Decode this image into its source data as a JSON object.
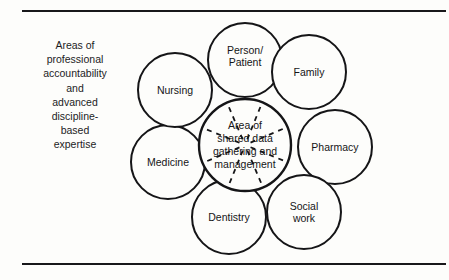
{
  "figure": {
    "title_caption": {
      "lines": [
        "Areas of",
        "professional",
        "accountability",
        "and",
        "advanced",
        "discipline-",
        "based",
        "expertise"
      ]
    },
    "center": {
      "name": "area-of-shared-data",
      "lines": [
        "Area of",
        "shared data",
        "gathering and",
        "management"
      ],
      "cx": 125,
      "cy": 135,
      "r": 46
    },
    "petals": [
      {
        "id": "person-patient",
        "lines": [
          "Person/",
          "Patient"
        ],
        "cx": 125,
        "cy": 50,
        "r": 37,
        "label_dy": -4
      },
      {
        "id": "family",
        "lines": [
          "Family"
        ],
        "cx": 189,
        "cy": 62,
        "r": 37,
        "label_dy": 0
      },
      {
        "id": "pharmacy",
        "lines": [
          "Pharmacy"
        ],
        "cx": 215,
        "cy": 137,
        "r": 37,
        "label_dy": 0
      },
      {
        "id": "social-work",
        "lines": [
          "Social",
          "work"
        ],
        "cx": 184,
        "cy": 202,
        "r": 37,
        "label_dy": 0
      },
      {
        "id": "dentistry",
        "lines": [
          "Dentistry"
        ],
        "cx": 109,
        "cy": 207,
        "r": 37,
        "label_dy": 0
      },
      {
        "id": "medicine",
        "lines": [
          "Medicine"
        ],
        "cx": 48,
        "cy": 152,
        "r": 37,
        "label_dy": 0
      },
      {
        "id": "nursing",
        "lines": [
          "Nursing"
        ],
        "cx": 55,
        "cy": 80,
        "r": 37,
        "label_dy": 0
      }
    ],
    "spokes": {
      "count": 8,
      "style": "dashed",
      "inner_radius": 6,
      "outer_radius": 44
    },
    "colors": {
      "background": "#fdfdfb",
      "stroke": "#151517",
      "text": "#1a1a1a",
      "rule": "#18181a"
    }
  }
}
